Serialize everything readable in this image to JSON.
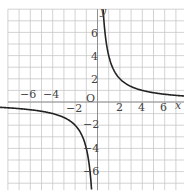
{
  "graph": {
    "function": "y = 4/x",
    "x_axis_label": "x",
    "y_axis_label": "y",
    "origin_label": "O",
    "x_ticks": [
      {
        "value": -6,
        "label": "−6"
      },
      {
        "value": -4,
        "label": "−4"
      },
      {
        "value": -2,
        "label": "−2"
      },
      {
        "value": 2,
        "label": "2"
      },
      {
        "value": 4,
        "label": "4"
      },
      {
        "value": 6,
        "label": "6"
      }
    ],
    "y_ticks": [
      {
        "value": 6,
        "label": "6"
      },
      {
        "value": 4,
        "label": "4"
      },
      {
        "value": 2,
        "label": "2"
      },
      {
        "value": -2,
        "label": "−2"
      },
      {
        "value": -4,
        "label": "−4"
      },
      {
        "value": -6,
        "label": "−6"
      }
    ],
    "range": {
      "x": [
        -8,
        8
      ],
      "y": [
        -8,
        8
      ]
    },
    "grid": true,
    "colors": {
      "grid": "#c8c8c8",
      "axis": "#888888",
      "curve": "#222222",
      "text": "#444444"
    }
  }
}
